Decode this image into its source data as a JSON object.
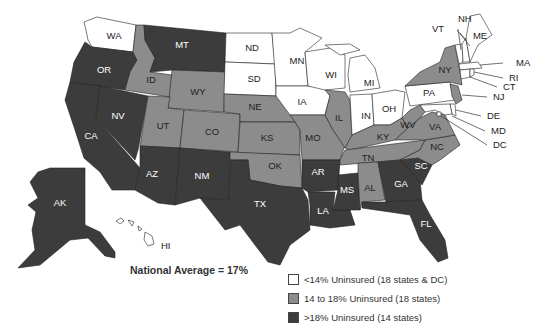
{
  "map": {
    "title_note": "National Average = 17%",
    "colors": {
      "low": "#ffffff",
      "mid": "#8c8c8c",
      "high": "#3c3c3c"
    },
    "legend": [
      {
        "key": "low",
        "label": "<14% Uninsured (18 states & DC)"
      },
      {
        "key": "mid",
        "label": "14 to 18% Uninsured (18 states)"
      },
      {
        "key": "high",
        "label": ">18% Uninsured (14 states)"
      }
    ],
    "states": {
      "WA": "low",
      "OR": "high",
      "CA": "high",
      "NV": "high",
      "ID": "mid",
      "MT": "high",
      "WY": "mid",
      "UT": "mid",
      "CO": "mid",
      "AZ": "high",
      "NM": "high",
      "ND": "low",
      "SD": "low",
      "NE": "mid",
      "KS": "mid",
      "OK": "mid",
      "TX": "high",
      "MN": "low",
      "IA": "low",
      "MO": "mid",
      "AR": "high",
      "LA": "high",
      "WI": "low",
      "IL": "mid",
      "MS": "high",
      "MI": "low",
      "IN": "low",
      "OH": "low",
      "KY": "mid",
      "TN": "mid",
      "AL": "mid",
      "GA": "high",
      "FL": "high",
      "SC": "high",
      "NC": "mid",
      "VA": "mid",
      "WV": "mid",
      "PA": "low",
      "NY": "mid",
      "NJ": "mid",
      "VT": "low",
      "NH": "low",
      "ME": "low",
      "MA": "low",
      "RI": "low",
      "CT": "low",
      "DE": "low",
      "MD": "low",
      "DC": "low",
      "AK": "high",
      "HI": "low"
    },
    "labels": {
      "WA": "WA",
      "OR": "OR",
      "CA": "CA",
      "NV": "NV",
      "ID": "ID",
      "MT": "MT",
      "WY": "WY",
      "UT": "UT",
      "CO": "CO",
      "AZ": "AZ",
      "NM": "NM",
      "ND": "ND",
      "SD": "SD",
      "NE": "NE",
      "KS": "KS",
      "OK": "OK",
      "TX": "TX",
      "MN": "MN",
      "IA": "IA",
      "MO": "MO",
      "AR": "AR",
      "LA": "LA",
      "WI": "WI",
      "IL": "IL",
      "MS": "MS",
      "MI": "MI",
      "IN": "IN",
      "OH": "OH",
      "KY": "KY",
      "TN": "TN",
      "AL": "AL",
      "GA": "GA",
      "FL": "FL",
      "SC": "SC",
      "NC": "NC",
      "VA": "VA",
      "WV": "WV",
      "PA": "PA",
      "NY": "NY",
      "NJ": "NJ",
      "VT": "VT",
      "NH": "NH",
      "ME": "ME",
      "MA": "MA",
      "RI": "RI",
      "CT": "CT",
      "DE": "DE",
      "MD": "MD",
      "DC": "DC",
      "AK": "AK",
      "HI": "HI"
    }
  },
  "chart_data": {
    "type": "choropleth",
    "title": "",
    "annotation": "National Average = 17%",
    "categories": [
      "<14% Uninsured (18 states & DC)",
      "14 to 18% Uninsured (18 states)",
      ">18% Uninsured (14 states)"
    ],
    "legend_position": "bottom-right",
    "groups": {
      "<14%": [
        "WA",
        "ND",
        "SD",
        "MN",
        "IA",
        "WI",
        "MI",
        "IN",
        "OH",
        "PA",
        "VT",
        "NH",
        "ME",
        "MA",
        "RI",
        "CT",
        "DE",
        "MD",
        "DC",
        "HI"
      ],
      "14-18%": [
        "ID",
        "WY",
        "UT",
        "CO",
        "NE",
        "KS",
        "OK",
        "MO",
        "IL",
        "KY",
        "TN",
        "AL",
        "NC",
        "VA",
        "WV",
        "NY",
        "NJ"
      ],
      ">18%": [
        "OR",
        "CA",
        "NV",
        "MT",
        "AZ",
        "NM",
        "TX",
        "AR",
        "LA",
        "MS",
        "GA",
        "FL",
        "SC",
        "AK"
      ]
    }
  }
}
